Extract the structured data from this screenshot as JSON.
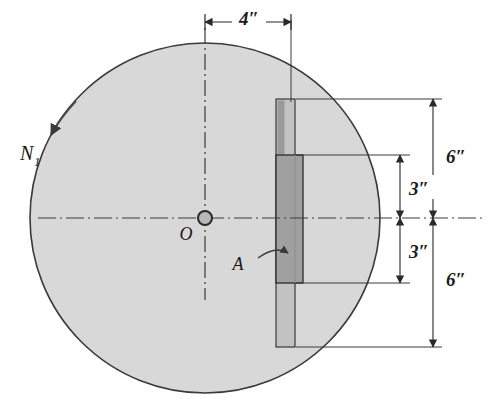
{
  "figure": {
    "background_color": "#ffffff",
    "disk": {
      "name": "disk",
      "fill_color": "#d8d8d8",
      "stroke_color": "#3a3a3a",
      "center_x": 205,
      "center_y": 218,
      "radius": 175
    },
    "center_marker": {
      "label": "O",
      "radius": 7
    },
    "force": {
      "label": "N",
      "subscript": "1",
      "description": "applied normal force arrow at upper-left of disk"
    },
    "area_callout": {
      "label": "A",
      "description": "leader pointing to shaded rectangular area"
    },
    "slot": {
      "outer_fill": "#c2c2c2",
      "inner_fill": "#a0a0a0",
      "stroke_color": "#2a2a2a"
    },
    "dimensions": [
      {
        "id": "width-4in",
        "label": "4″",
        "orientation": "horizontal",
        "value": 4,
        "unit": "in"
      },
      {
        "id": "upper-6in",
        "label": "6″",
        "orientation": "vertical",
        "value": 6,
        "unit": "in"
      },
      {
        "id": "upper-3in",
        "label": "3″",
        "orientation": "vertical",
        "value": 3,
        "unit": "in"
      },
      {
        "id": "lower-3in",
        "label": "3″",
        "orientation": "vertical",
        "value": 3,
        "unit": "in"
      },
      {
        "id": "lower-6in",
        "label": "6″",
        "orientation": "vertical",
        "value": 6,
        "unit": "in"
      }
    ]
  }
}
